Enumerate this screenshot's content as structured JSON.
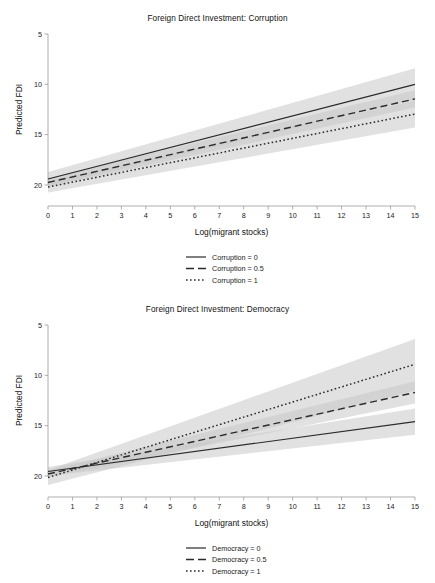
{
  "chart_data": [
    {
      "id": "corruption",
      "type": "line",
      "title": "Foreign Direct Investment: Corruption",
      "xlabel": "Log(migrant stocks)",
      "ylabel": "Predicted FDI",
      "xlim": [
        0,
        15
      ],
      "ylim": [
        5,
        20
      ],
      "xticks": [
        0,
        1,
        2,
        3,
        4,
        5,
        6,
        7,
        8,
        9,
        10,
        11,
        12,
        13,
        14,
        15
      ],
      "yticks": [
        5,
        10,
        15,
        20
      ],
      "grid": false,
      "legend_position": "bottom-center",
      "x": [
        0,
        15
      ],
      "series": [
        {
          "name": "Corruption = 0",
          "style": "solid",
          "values": [
            5.6,
            15.0
          ],
          "ci_low": [
            4.9,
            13.5
          ],
          "ci_high": [
            6.3,
            16.6
          ]
        },
        {
          "name": "Corruption = 0.5",
          "style": "dashed",
          "values": [
            5.25,
            13.55
          ],
          "ci_low": [
            4.8,
            12.7
          ],
          "ci_high": [
            5.7,
            14.4
          ]
        },
        {
          "name": "Corruption = 1",
          "style": "dotted",
          "values": [
            4.8,
            12.05
          ],
          "ci_low": [
            4.25,
            10.7
          ],
          "ci_high": [
            5.35,
            13.4
          ]
        }
      ]
    },
    {
      "id": "democracy",
      "type": "line",
      "title": "Foreign Direct Investment: Democracy",
      "xlabel": "Log(migrant stocks)",
      "ylabel": "Predicted FDI",
      "xlim": [
        0,
        15
      ],
      "ylim": [
        5,
        20
      ],
      "xticks": [
        0,
        1,
        2,
        3,
        4,
        5,
        6,
        7,
        8,
        9,
        10,
        11,
        12,
        13,
        14,
        15
      ],
      "yticks": [
        5,
        10,
        15,
        20
      ],
      "grid": false,
      "legend_position": "bottom-center",
      "x": [
        0,
        15
      ],
      "series": [
        {
          "name": "Democracy = 0",
          "style": "solid",
          "values": [
            5.45,
            10.4
          ],
          "ci_low": [
            5.0,
            9.1
          ],
          "ci_high": [
            5.9,
            11.7
          ]
        },
        {
          "name": "Democracy = 0.5",
          "style": "dashed",
          "values": [
            5.2,
            13.3
          ],
          "ci_low": [
            4.85,
            12.2
          ],
          "ci_high": [
            5.55,
            14.4
          ]
        },
        {
          "name": "Democracy = 1",
          "style": "dotted",
          "values": [
            4.85,
            16.1
          ],
          "ci_low": [
            4.1,
            13.5
          ],
          "ci_high": [
            5.6,
            18.6
          ]
        }
      ]
    }
  ],
  "panels": {
    "corruption": {
      "title": "Foreign Direct Investment: Corruption",
      "ylabel": "Predicted FDI",
      "xlabel": "Log(migrant stocks)",
      "yticks": [
        "20",
        "15",
        "10",
        "5"
      ],
      "xticks": [
        "0",
        "1",
        "2",
        "3",
        "4",
        "5",
        "6",
        "7",
        "8",
        "9",
        "10",
        "11",
        "12",
        "13",
        "14",
        "15"
      ],
      "legend": [
        {
          "label": "Corruption = 0",
          "style": "solid"
        },
        {
          "label": "Corruption = 0.5",
          "style": "dashed"
        },
        {
          "label": "Corruption = 1",
          "style": "dotted"
        }
      ]
    },
    "democracy": {
      "title": "Foreign Direct Investment: Democracy",
      "ylabel": "Predicted FDI",
      "xlabel": "Log(migrant stocks)",
      "yticks": [
        "20",
        "15",
        "10",
        "5"
      ],
      "xticks": [
        "0",
        "1",
        "2",
        "3",
        "4",
        "5",
        "6",
        "7",
        "8",
        "9",
        "10",
        "11",
        "12",
        "13",
        "14",
        "15"
      ],
      "legend": [
        {
          "label": "Democracy = 0",
          "style": "solid"
        },
        {
          "label": "Democracy = 0.5",
          "style": "dashed"
        },
        {
          "label": "Democracy = 1",
          "style": "dotted"
        }
      ]
    }
  },
  "colors": {
    "line": "#2b2b2b",
    "band": "#c9c9c9",
    "axis": "#9a9a9a",
    "text": "#1a1a1a",
    "background": "#ffffff"
  }
}
